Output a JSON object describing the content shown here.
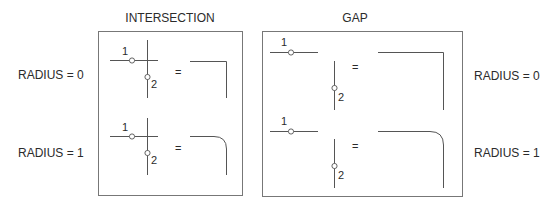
{
  "panels": {
    "intersection": {
      "title": "INTERSECTION",
      "rows": [
        {
          "radius_label": "RADIUS = 0",
          "point1": "1",
          "point2": "2",
          "equals": "=",
          "result": "sharp-corner"
        },
        {
          "radius_label": "RADIUS = 1",
          "point1": "1",
          "point2": "2",
          "equals": "=",
          "result": "rounded-corner"
        }
      ]
    },
    "gap": {
      "title": "GAP",
      "rows": [
        {
          "radius_label": "RADIUS = 0",
          "point1": "1",
          "point2": "2",
          "equals": "=",
          "result": "sharp-corner"
        },
        {
          "radius_label": "RADIUS = 1",
          "point1": "1",
          "point2": "2",
          "equals": "=",
          "result": "rounded-corner"
        }
      ]
    }
  },
  "colors": {
    "line": "#555555",
    "box": "#777777",
    "text": "#2b2b2b"
  }
}
